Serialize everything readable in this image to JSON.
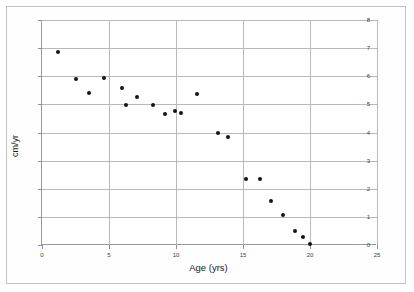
{
  "figure": {
    "background_color": "#ffffff",
    "frame_color": "#c2c2c2",
    "axis_color": "#9a9a9a",
    "grid_color": "#b9b9b9",
    "marker_color": "#151515"
  },
  "chart_data": {
    "type": "scatter",
    "title": "",
    "xlabel": "Age (yrs)",
    "ylabel": "cm/yr",
    "xlim": [
      0,
      25
    ],
    "ylim": [
      0,
      8
    ],
    "xticks": [
      0,
      5,
      10,
      15,
      20,
      25
    ],
    "yticks": [
      0,
      1,
      2,
      3,
      4,
      5,
      6,
      7,
      8
    ],
    "xtick_labels": [
      "0",
      "5",
      "10",
      "15",
      "20",
      "25"
    ],
    "ytick_labels": [
      "0",
      "1",
      "2",
      "3",
      "4",
      "5",
      "6",
      "7",
      "8"
    ],
    "grid": true,
    "grid_axis": "both",
    "legend": false,
    "legend_position": "none",
    "marker": "filled-circle",
    "series": [
      {
        "name": "Growth velocity",
        "x": [
          1.2,
          2.5,
          3.5,
          4.6,
          6.0,
          6.3,
          7.1,
          8.3,
          9.2,
          9.9,
          10.4,
          11.6,
          13.1,
          13.9,
          15.2,
          16.3,
          17.1,
          18.0,
          18.9,
          19.5,
          20.0
        ],
        "y": [
          6.85,
          5.9,
          5.4,
          5.95,
          5.6,
          4.97,
          5.25,
          4.97,
          4.65,
          4.75,
          4.7,
          5.37,
          4.0,
          3.85,
          2.35,
          2.35,
          1.55,
          1.05,
          0.5,
          0.3,
          0.05
        ]
      }
    ],
    "points": [
      {
        "x": 1.2,
        "y": 6.85
      },
      {
        "x": 2.5,
        "y": 5.9
      },
      {
        "x": 3.5,
        "y": 5.4
      },
      {
        "x": 4.6,
        "y": 5.95
      },
      {
        "x": 6.0,
        "y": 5.6
      },
      {
        "x": 6.3,
        "y": 4.97
      },
      {
        "x": 7.1,
        "y": 5.25
      },
      {
        "x": 8.3,
        "y": 4.97
      },
      {
        "x": 9.2,
        "y": 4.65
      },
      {
        "x": 9.9,
        "y": 4.75
      },
      {
        "x": 10.4,
        "y": 4.7
      },
      {
        "x": 11.6,
        "y": 5.37
      },
      {
        "x": 13.1,
        "y": 4.0
      },
      {
        "x": 13.9,
        "y": 3.85
      },
      {
        "x": 15.2,
        "y": 2.35
      },
      {
        "x": 16.3,
        "y": 2.35
      },
      {
        "x": 17.1,
        "y": 1.55
      },
      {
        "x": 18.0,
        "y": 1.05
      },
      {
        "x": 18.9,
        "y": 0.5
      },
      {
        "x": 19.5,
        "y": 0.3
      },
      {
        "x": 20.0,
        "y": 0.05
      }
    ]
  }
}
